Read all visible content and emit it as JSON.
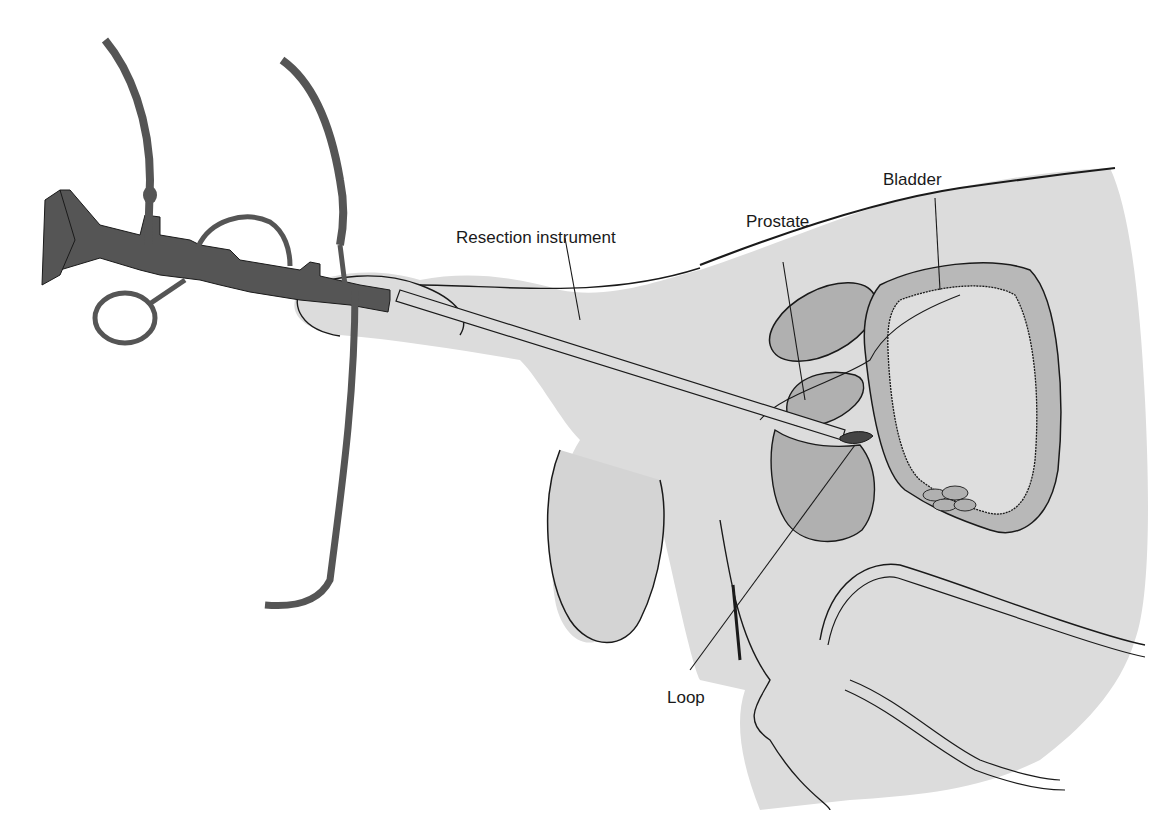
{
  "figure": {
    "type": "anatomical illustration"
  },
  "labels": {
    "resection_instrument": "Resection instrument",
    "prostate": "Prostate",
    "bladder": "Bladder",
    "loop": "Loop"
  },
  "colors": {
    "instrument": "#555555",
    "tissue": "#d9d9d9",
    "organ": "#b3b3b3",
    "loop": "#444444",
    "outline": "#1a1a1a",
    "background": "#ffffff"
  }
}
